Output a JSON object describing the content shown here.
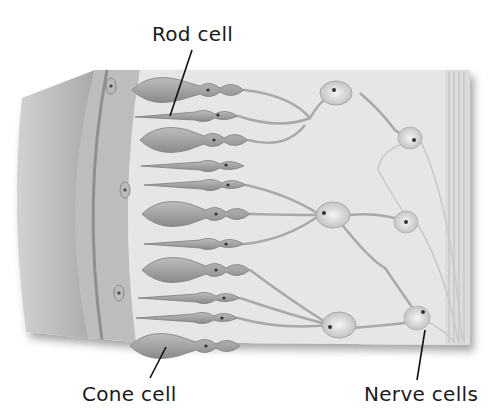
{
  "diagram": {
    "labels": {
      "rod_cell": "Rod cell",
      "cone_cell": "Cone cell",
      "nerve_cells": "Nerve cells"
    },
    "colors": {
      "background": "#ffffff",
      "tissue_light": "#e4e4e4",
      "tissue_mid": "#c8c8c8",
      "cell_fill": "#a8a8a8",
      "cell_dark": "#7a7a7a",
      "outer_layer": "#b5b5b5",
      "label_text": "#1a1a1a"
    }
  }
}
